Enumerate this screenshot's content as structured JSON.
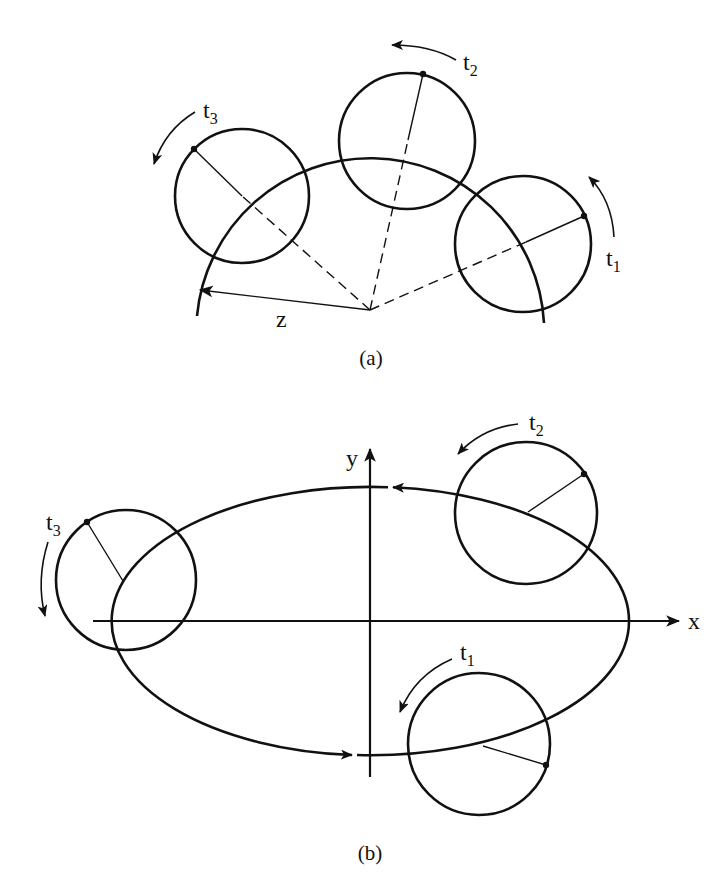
{
  "figure": {
    "panels": [
      {
        "id": "a",
        "caption": "(a)",
        "radius_label": "z",
        "circles": [
          {
            "label": "t",
            "subscript": "1",
            "rotation": "counterclockwise"
          },
          {
            "label": "t",
            "subscript": "2",
            "rotation": "counterclockwise"
          },
          {
            "label": "t",
            "subscript": "3",
            "rotation": "counterclockwise"
          }
        ],
        "path": "circular arc about center"
      },
      {
        "id": "b",
        "caption": "(b)",
        "axes": {
          "x_label": "x",
          "y_label": "y"
        },
        "circles": [
          {
            "label": "t",
            "subscript": "1",
            "rotation": "counterclockwise"
          },
          {
            "label": "t",
            "subscript": "2",
            "rotation": "counterclockwise"
          },
          {
            "label": "t",
            "subscript": "3",
            "rotation": "counterclockwise"
          }
        ],
        "path": "ellipse about origin, traversed counterclockwise"
      }
    ],
    "colors": {
      "ink": "#111111",
      "background": "#ffffff"
    }
  }
}
